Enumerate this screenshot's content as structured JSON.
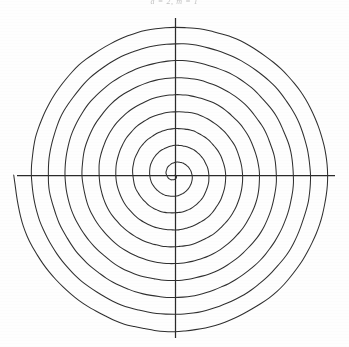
{
  "figure": {
    "caption": "a = 2,  m = 1",
    "background_color": "#fefefe",
    "width": 349,
    "height": 347
  },
  "chart_data": {
    "type": "line",
    "title": "a = 2,  m = 1",
    "subtitle": "",
    "coordinate_system": "polar",
    "curve_name": "Archimedean spiral",
    "equation": "r = aθ",
    "xlabel": "",
    "ylabel": "",
    "grid": false,
    "legend": null,
    "axes": {
      "origin_px": [
        175,
        175
      ],
      "x_axis_px": [
        17,
        335
      ],
      "y_axis_px": [
        18,
        338
      ],
      "x_axis_visible": true,
      "y_axis_visible": true,
      "tick_labels_x": [],
      "tick_labels_y": []
    },
    "series": [
      {
        "name": "spiral",
        "color": "#2f2f2f",
        "turns": 9.5,
        "theta_start_deg": 0,
        "theta_end_deg": 3420,
        "r_start_px": 0,
        "r_end_px": 161,
        "arm_spacing_px": 16.9,
        "direction": "clockwise-outward",
        "radius_at_theta_px": [
          {
            "theta_deg": 0,
            "r": 0
          },
          {
            "theta_deg": 180,
            "r": 9
          },
          {
            "theta_deg": 360,
            "r": 17
          },
          {
            "theta_deg": 540,
            "r": 25
          },
          {
            "theta_deg": 720,
            "r": 34
          },
          {
            "theta_deg": 900,
            "r": 42
          },
          {
            "theta_deg": 1080,
            "r": 51
          },
          {
            "theta_deg": 1260,
            "r": 59
          },
          {
            "theta_deg": 1440,
            "r": 68
          },
          {
            "theta_deg": 1620,
            "r": 76
          },
          {
            "theta_deg": 1800,
            "r": 85
          },
          {
            "theta_deg": 1980,
            "r": 93
          },
          {
            "theta_deg": 2160,
            "r": 102
          },
          {
            "theta_deg": 2340,
            "r": 110
          },
          {
            "theta_deg": 2520,
            "r": 119
          },
          {
            "theta_deg": 2700,
            "r": 127
          },
          {
            "theta_deg": 2880,
            "r": 136
          },
          {
            "theta_deg": 3060,
            "r": 144
          },
          {
            "theta_deg": 3240,
            "r": 153
          },
          {
            "theta_deg": 3420,
            "r": 161
          }
        ],
        "crossings_positive_x_px": [
          17,
          34,
          51,
          68,
          85,
          102,
          119,
          136,
          153
        ],
        "crossings_negative_x_px": [
          9,
          25,
          42,
          59,
          76,
          93,
          110,
          127,
          144,
          161
        ]
      }
    ]
  }
}
